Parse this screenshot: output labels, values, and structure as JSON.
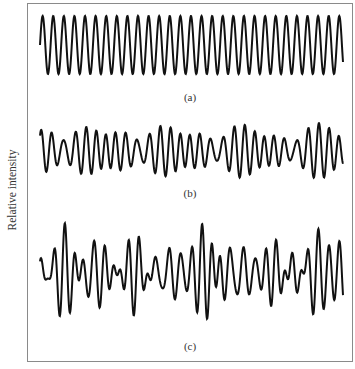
{
  "figure": {
    "y_axis_label": "Relative intensity",
    "line_color": "#111111",
    "frame_color": "#8a8a8a"
  },
  "chart_data": {
    "type": "line",
    "title": "",
    "xlabel": "",
    "ylabel": "Relative intensity",
    "grid": false,
    "legend": "none",
    "x_range_px": [
      40,
      343
    ],
    "panels": [
      {
        "label": "(a)",
        "description": "single pure sinusoid, constant amplitude",
        "center_y": 45,
        "components": [
          {
            "cycles": 28.6,
            "amplitude": 29,
            "phase": 0
          }
        ]
      },
      {
        "label": "(b)",
        "description": "superposition of a few close frequencies (beat pattern)",
        "center_y": 151,
        "components": [
          {
            "cycles": 28.6,
            "amplitude": 14,
            "phase": 0
          },
          {
            "cycles": 32.6,
            "amplitude": 10,
            "phase": 1.2
          },
          {
            "cycles": 24.8,
            "amplitude": 7,
            "phase": 2.1
          }
        ]
      },
      {
        "label": "(c)",
        "description": "superposition of many frequencies (irregular pattern)",
        "center_y": 273,
        "components": [
          {
            "cycles": 28.6,
            "amplitude": 16,
            "phase": 0
          },
          {
            "cycles": 24.2,
            "amplitude": 12,
            "phase": 0.8
          },
          {
            "cycles": 33.4,
            "amplitude": 11,
            "phase": 2.4
          },
          {
            "cycles": 20.1,
            "amplitude": 9,
            "phase": 4.0
          },
          {
            "cycles": 37.2,
            "amplitude": 8,
            "phase": 1.6
          },
          {
            "cycles": 30.9,
            "amplitude": 6,
            "phase": 5.1
          }
        ]
      }
    ]
  },
  "labels": {
    "a": {
      "text": "(a)",
      "x": 190,
      "y": 92
    },
    "b": {
      "text": "(b)",
      "x": 190,
      "y": 188
    },
    "c": {
      "text": "(c)",
      "x": 190,
      "y": 341
    }
  }
}
